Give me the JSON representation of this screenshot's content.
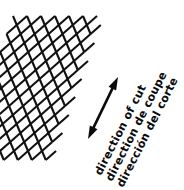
{
  "figure": {
    "background_color": "#ffffff",
    "ink_color": "#0b0b0b",
    "width": 184,
    "height": 190
  },
  "mesh": {
    "name": "expanded-metal-diamond-mesh",
    "description": "Diamond lattice / expanded metal mesh pattern",
    "stroke_color": "#111111",
    "stroke_width": 2.1,
    "cell_width": 14,
    "cell_height": 18,
    "columns": 6,
    "rows": 8,
    "origin_x": 13,
    "origin_y": 16,
    "shear_per_row": -3.2
  },
  "arrow": {
    "name": "double-headed-direction-arrow",
    "color": "#0b0b0b",
    "tail_x": 88,
    "tail_y": 139,
    "tip_x": 118,
    "tip_y": 77,
    "shaft_width": 2.6,
    "double_headed": true,
    "head_length": 13,
    "head_half_width": 4.2
  },
  "labels": {
    "rotation_deg": -63,
    "lines": [
      {
        "id": "line-english",
        "text": "direction of cut",
        "language": "English",
        "x": 101,
        "y": 176,
        "offset": 0
      },
      {
        "id": "line-french",
        "text": "direction de coupe",
        "language": "French",
        "x": 112,
        "y": 182,
        "offset": 1
      },
      {
        "id": "line-spanish",
        "text": "dirección del corte",
        "language": "Spanish",
        "x": 123,
        "y": 188,
        "offset": 2
      }
    ]
  }
}
